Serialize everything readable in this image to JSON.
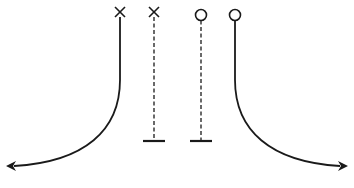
{
  "diagram": {
    "type": "route-diagram",
    "ink_color": "#1a1a1a",
    "background_color": "#ffffff",
    "routes": [
      {
        "id": "x-solid",
        "top_marker": "x",
        "line_style": "solid",
        "end_marker": "arrow",
        "direction": "curves-left"
      },
      {
        "id": "x-dashed",
        "top_marker": "x",
        "line_style": "dashed",
        "end_marker": "t-bar",
        "direction": "straight-down"
      },
      {
        "id": "o-dashed",
        "top_marker": "circle",
        "line_style": "dashed",
        "end_marker": "t-bar",
        "direction": "straight-down"
      },
      {
        "id": "o-solid",
        "top_marker": "circle",
        "line_style": "solid",
        "end_marker": "arrow",
        "direction": "curves-right"
      }
    ]
  }
}
